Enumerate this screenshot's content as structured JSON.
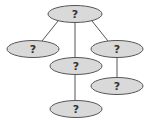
{
  "diagram": {
    "type": "tree",
    "colors": {
      "node_fill": "#d9d9d9",
      "node_stroke": "#555555",
      "edge": "#555555",
      "label": "#333333"
    },
    "nodes": [
      {
        "id": "root",
        "label": "?",
        "cx": 75,
        "cy": 14,
        "rx": 27,
        "ry": 8.5
      },
      {
        "id": "left",
        "label": "?",
        "cx": 33,
        "cy": 49,
        "rx": 26,
        "ry": 8.5
      },
      {
        "id": "middle",
        "label": "?",
        "cx": 76,
        "cy": 66,
        "rx": 26,
        "ry": 8.5
      },
      {
        "id": "right",
        "label": "?",
        "cx": 117,
        "cy": 49,
        "rx": 26,
        "ry": 8.5
      },
      {
        "id": "middle-child",
        "label": "?",
        "cx": 76,
        "cy": 109,
        "rx": 26,
        "ry": 8.5
      },
      {
        "id": "right-child",
        "label": "?",
        "cx": 117,
        "cy": 86,
        "rx": 26,
        "ry": 8.5
      }
    ],
    "edges": [
      {
        "from": "root",
        "to": "left"
      },
      {
        "from": "root",
        "to": "middle"
      },
      {
        "from": "root",
        "to": "right"
      },
      {
        "from": "middle",
        "to": "middle-child"
      },
      {
        "from": "right",
        "to": "right-child"
      }
    ]
  }
}
